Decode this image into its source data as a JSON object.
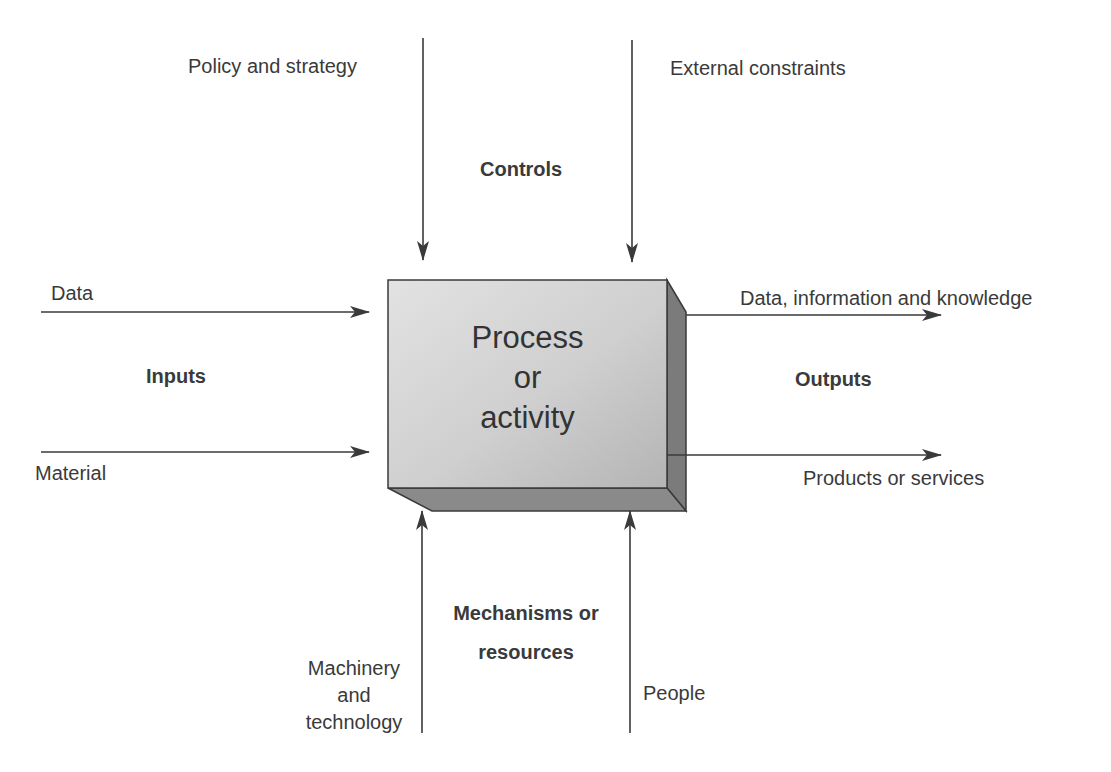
{
  "diagram": {
    "type": "IDEF0 process model",
    "process": {
      "lines": [
        "Process",
        "or",
        "activity"
      ]
    },
    "controls": {
      "heading": "Controls",
      "items": [
        "Policy and strategy",
        "External constraints"
      ]
    },
    "inputs": {
      "heading": "Inputs",
      "items": [
        "Data",
        "Material"
      ]
    },
    "outputs": {
      "heading": "Outputs",
      "items": [
        "Data, information and knowledge",
        "Products or services"
      ]
    },
    "mechanisms": {
      "heading_lines": [
        "Mechanisms or",
        "resources"
      ],
      "items": [
        {
          "lines": [
            "Machinery",
            "and",
            "technology"
          ]
        },
        {
          "lines": [
            "People"
          ]
        }
      ]
    },
    "colors": {
      "line": "#3a3a3a",
      "box_face_light": "#d6d6d6",
      "box_face_dark": "#b9b9b9",
      "box_side": "#7a7a7a",
      "box_bottom": "#8a8a8a",
      "text": "#3a3a3a"
    }
  }
}
